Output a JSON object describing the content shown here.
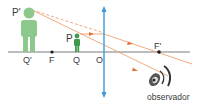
{
  "diagram": {
    "labels": {
      "image_top": "P'",
      "image_base": "Q'",
      "focus_object": "F",
      "object_top": "P",
      "object_base": "Q",
      "optical_center": "O",
      "focus_image": "F'",
      "observer": "observador"
    },
    "colors": {
      "axis": "#7a7a7a",
      "lens": "#3a9ad9",
      "ray": "#f0a070",
      "ray_arrow": "#e8703a",
      "image_figure": "#8cc88c",
      "object_figure": "#3e9a4a",
      "point": "#1a1a1a",
      "eye": "#333333"
    }
  }
}
